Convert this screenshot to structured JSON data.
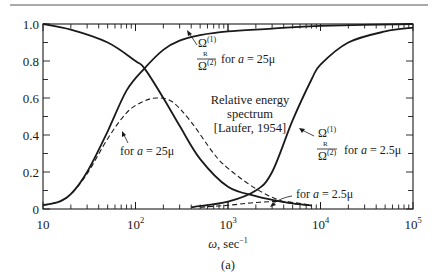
{
  "chart_data": {
    "type": "line",
    "title": "Relative energy spectrum [Laufer, 1954]",
    "caption": "(a)",
    "xlabel": "ω, sec⁻¹",
    "ylabel": "",
    "xscale": "log",
    "xlim": [
      10,
      100000
    ],
    "ylim": [
      0,
      1.0
    ],
    "grid": false,
    "x_tick_labels": [
      {
        "value": 10,
        "base": "10",
        "exp": ""
      },
      {
        "value": 100,
        "base": "10",
        "exp": "2"
      },
      {
        "value": 1000,
        "base": "10",
        "exp": "3"
      },
      {
        "value": 10000,
        "base": "10",
        "exp": "4"
      },
      {
        "value": 100000,
        "base": "10",
        "exp": "5"
      }
    ],
    "y_tick_labels": [
      "0",
      "0.2",
      "0.4",
      "0.6",
      "0.8",
      "1.0"
    ],
    "y_ticks": [
      0,
      0.2,
      0.4,
      0.6,
      0.8,
      1.0
    ],
    "series": [
      {
        "name": "falling spectrum (common)",
        "style": "solid",
        "x": [
          10,
          20,
          50,
          100,
          125,
          200,
          300,
          500,
          1000,
          2000,
          3000,
          5000,
          8000
        ],
        "y": [
          1.0,
          0.97,
          0.9,
          0.8,
          0.76,
          0.6,
          0.45,
          0.27,
          0.12,
          0.07,
          0.05,
          0.03,
          0.02
        ]
      },
      {
        "name": "Ω_R(1)/Ω(2) for a = 25μ",
        "style": "solid",
        "x": [
          10,
          15,
          20,
          30,
          50,
          80,
          125,
          200,
          300,
          500,
          1000,
          3000,
          10000,
          100000
        ],
        "y": [
          0.02,
          0.04,
          0.08,
          0.2,
          0.42,
          0.64,
          0.76,
          0.86,
          0.91,
          0.94,
          0.96,
          0.975,
          0.99,
          1.0
        ]
      },
      {
        "name": "for a = 25μ",
        "style": "dashed",
        "x": [
          10,
          15,
          20,
          30,
          50,
          80,
          120,
          170,
          250,
          400,
          700,
          1000,
          2000,
          4000,
          8000
        ],
        "y": [
          0.02,
          0.04,
          0.08,
          0.19,
          0.38,
          0.52,
          0.58,
          0.6,
          0.58,
          0.47,
          0.3,
          0.22,
          0.11,
          0.04,
          0.02
        ]
      },
      {
        "name": "Ω_R(1)/Ω(2) for a = 2.5μ",
        "style": "solid",
        "x": [
          400,
          1000,
          2000,
          3000,
          5000,
          8000,
          10000,
          20000,
          50000,
          100000
        ],
        "y": [
          0.01,
          0.04,
          0.1,
          0.2,
          0.48,
          0.7,
          0.78,
          0.9,
          0.96,
          0.98
        ]
      },
      {
        "name": "for a = 2.5μ",
        "style": "dashed",
        "x": [
          500,
          1000,
          2000,
          4000,
          8000
        ],
        "y": [
          0.01,
          0.02,
          0.035,
          0.04,
          0.02
        ]
      }
    ],
    "annotations": [
      {
        "id": "ann1",
        "num": "Ω",
        "num_sup": "(1)",
        "num_sub": "R",
        "den": "Ω",
        "den_sup": "(2)",
        "text": "for a = 25μ"
      },
      {
        "id": "ann2",
        "num": "Ω",
        "num_sup": "(1)",
        "num_sub": "R",
        "den": "Ω",
        "den_sup": "(2)",
        "text": "for a = 2.5μ"
      },
      {
        "id": "ann3",
        "text": "for a = 25μ"
      },
      {
        "id": "ann4",
        "text": "for a = 2.5μ"
      },
      {
        "id": "title",
        "lines": [
          "Relative energy",
          "spectrum",
          "[Laufer, 1954]"
        ]
      }
    ]
  },
  "labels": {
    "title_line1": "Relative energy",
    "title_line2": "spectrum",
    "title_line3": "[Laufer, 1954]",
    "xlabel_omega": "ω,",
    "xlabel_unit": "sec",
    "xlabel_exp": "−1",
    "caption": "(a)",
    "ann_omega": "Ω",
    "ann_sup1": "(1)",
    "ann_subR": "R",
    "ann_sup2": "(2)",
    "ann_for": "for",
    "ann_a": "a",
    "ann_eq25": " = 25μ",
    "ann_eq2_5": " = 2.5μ"
  }
}
